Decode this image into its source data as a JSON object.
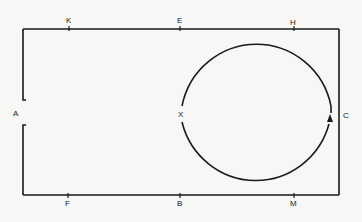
{
  "diagram": {
    "labels": {
      "K": "K",
      "E": "E",
      "H": "H",
      "A": "A",
      "X": "X",
      "C": "C",
      "F": "F",
      "B": "B",
      "M": "M"
    },
    "colors": {
      "line": "#1a1a1a",
      "background": "#f7f7f5"
    },
    "circle": {
      "direction": "counterclockwise-from-X-via-bottom-to-top",
      "arrow_icon": "arrowhead-up"
    }
  }
}
